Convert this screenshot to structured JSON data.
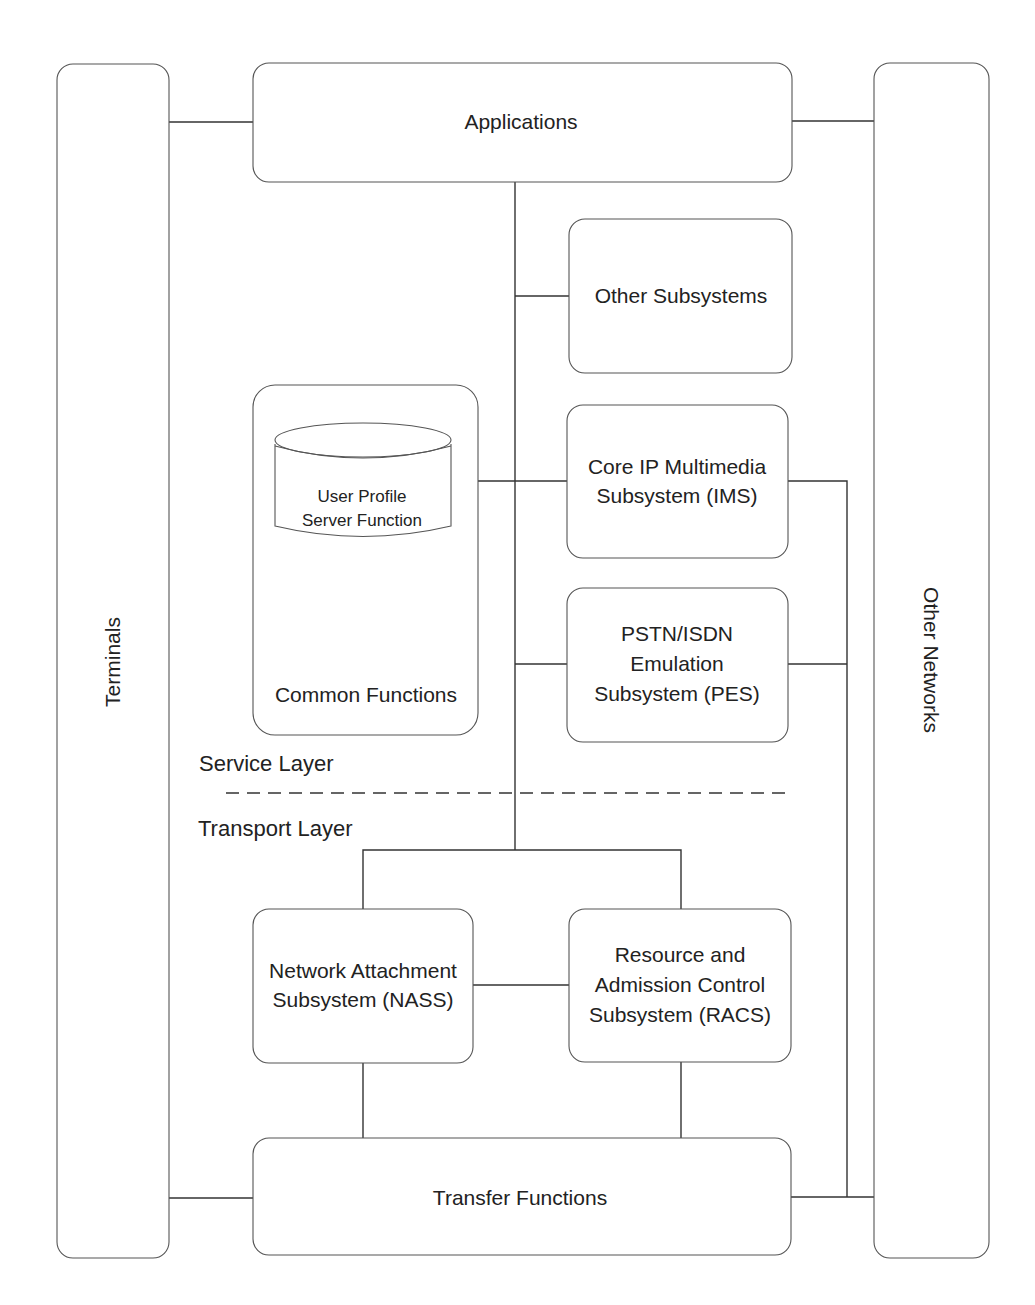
{
  "diagram": {
    "side_columns": {
      "left": {
        "label": "Terminals"
      },
      "right": {
        "label": "Other Networks"
      }
    },
    "top_box": {
      "label": "Applications"
    },
    "service_layer": {
      "label": "Service Layer",
      "common_functions": {
        "label": "Common Functions",
        "database": {
          "line1": "User Profile",
          "line2": "Server Function"
        }
      },
      "subsystems": [
        {
          "id": "other",
          "lines": [
            "Other Subsystems"
          ]
        },
        {
          "id": "ims",
          "lines": [
            "Core IP Multimedia",
            "Subsystem (IMS)"
          ]
        },
        {
          "id": "pes",
          "lines": [
            "PSTN/ISDN",
            "Emulation",
            "Subsystem (PES)"
          ]
        }
      ]
    },
    "transport_layer": {
      "label": "Transport Layer",
      "subsystems": [
        {
          "id": "nass",
          "lines": [
            "Network Attachment",
            "Subsystem (NASS)"
          ]
        },
        {
          "id": "racs",
          "lines": [
            "Resource and",
            "Admission Control",
            "Subsystem (RACS)"
          ]
        }
      ],
      "transfer_functions": {
        "label": "Transfer Functions"
      }
    },
    "colors": {
      "stroke": "#555555",
      "connector": "#333333",
      "text": "#222222",
      "background": "#ffffff"
    }
  }
}
